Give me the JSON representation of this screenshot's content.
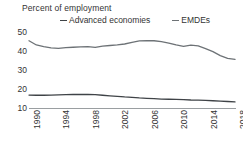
{
  "chart_data": {
    "type": "line",
    "title": "Percent of employment",
    "xlabel": "",
    "ylabel": "Percent of employment",
    "ylim": [
      10,
      52
    ],
    "xlim": [
      1990,
      2018
    ],
    "grid": false,
    "legend_position": "top",
    "y_ticks": [
      "50",
      "40",
      "30",
      "20",
      "10"
    ],
    "y_tick_values": [
      50,
      40,
      30,
      20,
      10
    ],
    "x_ticks": [
      "1990",
      "1994",
      "1998",
      "2002",
      "2006",
      "2010",
      "2014",
      "2018"
    ],
    "x_tick_values": [
      1990,
      1994,
      1998,
      2002,
      2006,
      2010,
      2014,
      2018
    ],
    "x": [
      1990,
      1991,
      1992,
      1993,
      1994,
      1995,
      1996,
      1997,
      1998,
      1999,
      2000,
      2001,
      2002,
      2003,
      2004,
      2005,
      2006,
      2007,
      2008,
      2009,
      2010,
      2011,
      2012,
      2013,
      2014,
      2015,
      2016,
      2017,
      2018
    ],
    "series": [
      {
        "name": "Advanced economies",
        "color": "#3f4347",
        "values": [
          16.8,
          16.7,
          16.7,
          16.8,
          16.9,
          17.0,
          17.1,
          17.1,
          17.1,
          17.0,
          16.7,
          16.4,
          16.1,
          15.8,
          15.6,
          15.3,
          15.1,
          14.9,
          14.7,
          14.6,
          14.5,
          14.4,
          14.2,
          14.1,
          14.0,
          13.8,
          13.6,
          13.4,
          13.2
        ]
      },
      {
        "name": "EMDEs",
        "color": "#6d7276",
        "values": [
          45.3,
          43.1,
          42.2,
          41.6,
          41.3,
          41.7,
          41.9,
          42.1,
          42.2,
          41.8,
          42.5,
          42.8,
          43.1,
          43.6,
          44.4,
          45.2,
          45.4,
          45.3,
          44.8,
          44.1,
          43.1,
          42.3,
          43.0,
          42.6,
          41.2,
          39.6,
          37.5,
          36.1,
          35.5
        ]
      }
    ]
  },
  "legend": {
    "entries": [
      {
        "label": "Advanced economies"
      },
      {
        "label": "EMDEs"
      }
    ]
  },
  "colors": {
    "advanced": "#3f4347",
    "emdes": "#6d7276",
    "axis": "#9a9ea1",
    "text": "#333333",
    "background": "#ffffff"
  }
}
